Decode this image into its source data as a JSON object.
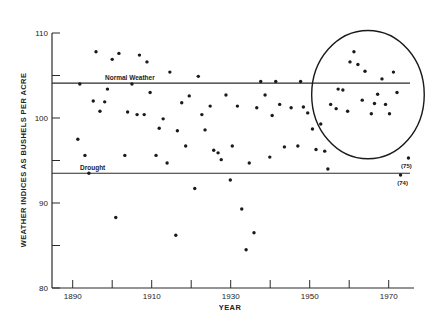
{
  "chart_data": {
    "type": "scatter",
    "title": "",
    "xlabel": "YEAR",
    "ylabel": "WEATHER INDICES AS BUSHELS PER ACRE",
    "xlim": [
      1890,
      1976
    ],
    "ylim": [
      80,
      110
    ],
    "x_ticks": [
      1890,
      1900,
      1910,
      1920,
      1930,
      1940,
      1950,
      1960,
      1970
    ],
    "x_tick_labels": [
      "1890",
      "",
      "1910",
      "",
      "1930",
      "",
      "1950",
      "",
      "1970"
    ],
    "y_ticks": [
      80,
      85,
      90,
      95,
      100,
      105,
      110
    ],
    "y_tick_labels": [
      "80",
      "",
      "90",
      "",
      "100",
      "",
      "110"
    ],
    "grid": false,
    "legend": null,
    "reference_lines": [
      {
        "name": "Normal Weather",
        "value": 104.1
      },
      {
        "name": "Drought",
        "value": 93.5
      }
    ],
    "highlight": {
      "shape": "ellipse",
      "x_range": [
        1950.5,
        1979
      ],
      "y_range": [
        95.2,
        110.3
      ],
      "label": ""
    },
    "annotations": [
      {
        "text": "(75)",
        "x": 1975,
        "y": 95.3
      },
      {
        "text": "(74)",
        "x": 1973,
        "y": 93.3
      }
    ],
    "series": [
      {
        "name": "Weather index",
        "points": [
          [
            1891.3,
            97.5
          ],
          [
            1891.8,
            104.0
          ],
          [
            1893.1,
            95.6
          ],
          [
            1894.1,
            93.5
          ],
          [
            1895.2,
            102.0
          ],
          [
            1895.9,
            107.8
          ],
          [
            1896.9,
            100.8
          ],
          [
            1898.1,
            101.9
          ],
          [
            1898.8,
            103.4
          ],
          [
            1900.0,
            106.9
          ],
          [
            1900.9,
            88.3
          ],
          [
            1901.7,
            107.6
          ],
          [
            1903.2,
            95.6
          ],
          [
            1903.9,
            100.7
          ],
          [
            1905.0,
            104.0
          ],
          [
            1906.3,
            100.4
          ],
          [
            1906.9,
            107.4
          ],
          [
            1908.1,
            100.4
          ],
          [
            1908.8,
            106.6
          ],
          [
            1909.6,
            103.0
          ],
          [
            1911.1,
            95.6
          ],
          [
            1911.9,
            98.8
          ],
          [
            1912.9,
            99.9
          ],
          [
            1913.9,
            94.7
          ],
          [
            1914.6,
            105.4
          ],
          [
            1916.1,
            86.2
          ],
          [
            1916.5,
            98.5
          ],
          [
            1917.6,
            101.8
          ],
          [
            1918.6,
            96.7
          ],
          [
            1919.5,
            102.6
          ],
          [
            1920.9,
            91.7
          ],
          [
            1921.8,
            104.9
          ],
          [
            1922.7,
            100.4
          ],
          [
            1923.5,
            98.6
          ],
          [
            1924.8,
            101.4
          ],
          [
            1925.7,
            96.2
          ],
          [
            1926.8,
            95.9
          ],
          [
            1927.6,
            95.1
          ],
          [
            1928.8,
            102.7
          ],
          [
            1929.9,
            92.7
          ],
          [
            1930.4,
            96.7
          ],
          [
            1931.7,
            101.4
          ],
          [
            1932.8,
            89.3
          ],
          [
            1933.9,
            84.5
          ],
          [
            1934.7,
            94.7
          ],
          [
            1935.9,
            86.5
          ],
          [
            1936.6,
            101.2
          ],
          [
            1937.6,
            104.3
          ],
          [
            1938.7,
            102.7
          ],
          [
            1939.9,
            95.4
          ],
          [
            1940.5,
            100.3
          ],
          [
            1941.4,
            104.3
          ],
          [
            1942.4,
            101.6
          ],
          [
            1943.6,
            96.6
          ],
          [
            1945.3,
            101.2
          ],
          [
            1947.0,
            96.7
          ],
          [
            1947.7,
            104.3
          ],
          [
            1948.4,
            101.3
          ],
          [
            1949.5,
            100.6
          ],
          [
            1950.7,
            98.7
          ],
          [
            1951.6,
            96.3
          ],
          [
            1952.8,
            99.3
          ],
          [
            1953.8,
            96.1
          ],
          [
            1954.6,
            94.0
          ],
          [
            1955.3,
            101.6
          ],
          [
            1956.7,
            101.1
          ],
          [
            1957.2,
            103.4
          ],
          [
            1958.4,
            103.3
          ],
          [
            1959.6,
            100.8
          ],
          [
            1960.2,
            106.6
          ],
          [
            1961.2,
            107.8
          ],
          [
            1962.2,
            106.3
          ],
          [
            1963.3,
            102.1
          ],
          [
            1964.0,
            105.5
          ],
          [
            1965.6,
            100.5
          ],
          [
            1966.4,
            101.7
          ],
          [
            1967.2,
            102.8
          ],
          [
            1968.3,
            104.6
          ],
          [
            1969.2,
            101.6
          ],
          [
            1970.2,
            100.5
          ],
          [
            1971.2,
            105.4
          ],
          [
            1972.1,
            103.0
          ],
          [
            1973.0,
            93.3
          ],
          [
            1975.0,
            95.3
          ]
        ]
      }
    ]
  }
}
